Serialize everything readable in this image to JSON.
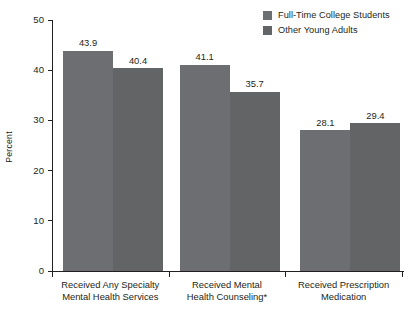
{
  "chart_data": {
    "type": "bar",
    "title": "",
    "subtitle": "",
    "xlabel": "",
    "ylabel": "Percent",
    "ylim": [
      0,
      50
    ],
    "yticks": [
      0,
      10,
      20,
      30,
      40,
      50
    ],
    "ytick_labels": [
      "0",
      "10",
      "20",
      "30",
      "40",
      "50"
    ],
    "grid": false,
    "legend_position": "top-right",
    "categories": [
      "Received Any Specialty Mental Health Services",
      "Received Mental Health Counseling*",
      "Received Prescription Medication"
    ],
    "category_lines": [
      [
        "Received Any Specialty",
        "Mental Health Services"
      ],
      [
        "Received Mental",
        "Health Counseling*"
      ],
      [
        "Received Prescription",
        "Medication"
      ]
    ],
    "series": [
      {
        "name": "Full-Time College Students",
        "color": "#6d6e71",
        "values": [
          43.9,
          41.1,
          28.1
        ],
        "labels": [
          "43.9",
          "41.1",
          "28.1"
        ]
      },
      {
        "name": "Other Young Adults",
        "color": "#636466",
        "values": [
          40.4,
          35.7,
          29.4
        ],
        "labels": [
          "40.4",
          "35.7",
          "29.4"
        ]
      }
    ]
  },
  "legend": {
    "items": [
      {
        "label": "Full-Time College Students",
        "color": "#6d6e71"
      },
      {
        "label": "Other Young Adults",
        "color": "#636466"
      }
    ]
  },
  "axes": {
    "y_title": "Percent",
    "tick_labels": [
      "50",
      "40",
      "30",
      "20",
      "10",
      "0"
    ]
  },
  "colors": {
    "axis": "#231f20",
    "text": "#231f20",
    "background": "#ffffff",
    "series_1": "#6d6e71",
    "series_2": "#636466"
  }
}
